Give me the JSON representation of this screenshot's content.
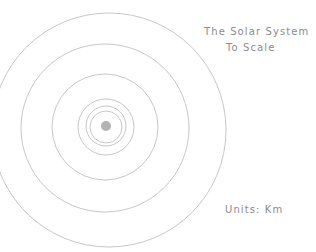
{
  "figure": {
    "title_line_1": "The Solar System",
    "title_line_2": "To Scale",
    "units_label": "Units: Km",
    "line_color": "#b9b9bd",
    "sun_color": "#9a9a9e",
    "background_color": "#ffffff"
  },
  "chart_data": {
    "type": "scatter",
    "title": "The Solar System To Scale",
    "subtitle": "To Scale",
    "xlabel": "",
    "ylabel": "",
    "annotations": [
      "The Solar System",
      "To Scale",
      "Units: Km"
    ],
    "units": "Km",
    "grid": false,
    "legend": "none",
    "center": {
      "x": 106,
      "y": 127
    },
    "sun": {
      "x": 106,
      "y": 126,
      "radius": 5
    },
    "orbits": [
      {
        "name": "orbit-1",
        "cx": 106,
        "cy": 127,
        "r": 16
      },
      {
        "name": "orbit-2",
        "cx": 106,
        "cy": 126,
        "r": 20
      },
      {
        "name": "orbit-3",
        "cx": 106,
        "cy": 127,
        "r": 28
      },
      {
        "name": "orbit-4",
        "cx": 105,
        "cy": 127,
        "r": 53
      },
      {
        "name": "orbit-5",
        "cx": 105,
        "cy": 128,
        "r": 84
      },
      {
        "name": "orbit-6",
        "cx": 109,
        "cy": 130,
        "r": 117
      }
    ]
  }
}
